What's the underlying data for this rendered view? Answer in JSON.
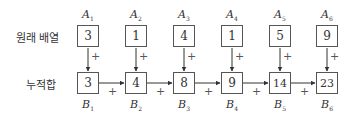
{
  "labels": {
    "original": "원래 배열",
    "prefix": "누적합"
  },
  "plus_sign": "+",
  "top_row": [
    {
      "name": "A",
      "index": "1",
      "value": "3"
    },
    {
      "name": "A",
      "index": "2",
      "value": "1"
    },
    {
      "name": "A",
      "index": "3",
      "value": "4"
    },
    {
      "name": "A",
      "index": "4",
      "value": "1"
    },
    {
      "name": "A",
      "index": "5",
      "value": "5"
    },
    {
      "name": "A",
      "index": "6",
      "value": "9"
    }
  ],
  "bottom_row": [
    {
      "name": "B",
      "index": "1",
      "value": "3"
    },
    {
      "name": "B",
      "index": "2",
      "value": "4"
    },
    {
      "name": "B",
      "index": "3",
      "value": "8"
    },
    {
      "name": "B",
      "index": "4",
      "value": "9"
    },
    {
      "name": "B",
      "index": "5",
      "value": "14"
    },
    {
      "name": "B",
      "index": "6",
      "value": "23"
    }
  ]
}
